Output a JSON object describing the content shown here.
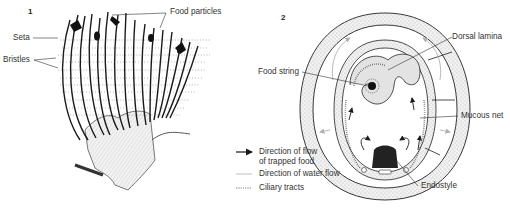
{
  "panels": [
    {
      "number": "1",
      "labels": {
        "food_particles": "Food particles",
        "seta": "Seta",
        "bristles": "Bristles"
      }
    },
    {
      "number": "2",
      "labels": {
        "dorsal_lamina": "Dorsal lamina",
        "food_string": "Food string",
        "mucous_net": "Mucous net",
        "endostyle": "Endostyle"
      }
    }
  ],
  "legend": [
    {
      "icon": "dark-arrow-icon",
      "text_line1": "Direction of flow",
      "text_line2": "of trapped food"
    },
    {
      "icon": "light-arrow-icon",
      "text_line1": "Direction of water flow",
      "text_line2": ""
    },
    {
      "icon": "ciliary-hatch-icon",
      "text_line1": "Ciliary tracts",
      "text_line2": ""
    }
  ],
  "colors": {
    "ink": "#1a1a1a",
    "gray_fill": "#dcdcdc",
    "stipple": "#e6e6e6",
    "light_arrow": "#b0b0b0"
  }
}
